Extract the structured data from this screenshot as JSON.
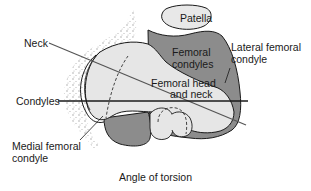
{
  "diagram": {
    "title": "Angle of torsion",
    "labels": {
      "patella": "Patella",
      "neck": "Neck",
      "femoral_condyles_1": "Femoral",
      "femoral_condyles_2": "condyles",
      "lateral_femoral_condyle_1": "Lateral femoral",
      "lateral_femoral_condyle_2": "condyle",
      "femoral_head_neck_1": "Femoral head",
      "femoral_head_neck_2": "and neck",
      "condyles": "Condyles",
      "medial_femoral_condyle_1": "Medial femoral",
      "medial_femoral_condyle_2": "condyle"
    },
    "colors": {
      "condyle_fill": "#8c8c8c",
      "head_fill": "#e6e6e6",
      "patella_fill": "#e8e8e8",
      "stipple": "#a0a0a0",
      "line": "#1a1a1a",
      "neck_axis": "#555555"
    },
    "axes": {
      "neck_axis": {
        "x1": 49,
        "y1": 43,
        "x2": 246,
        "y2": 125
      },
      "condylar_axis": {
        "x1": 58,
        "y1": 101,
        "x2": 248,
        "y2": 101
      }
    }
  }
}
